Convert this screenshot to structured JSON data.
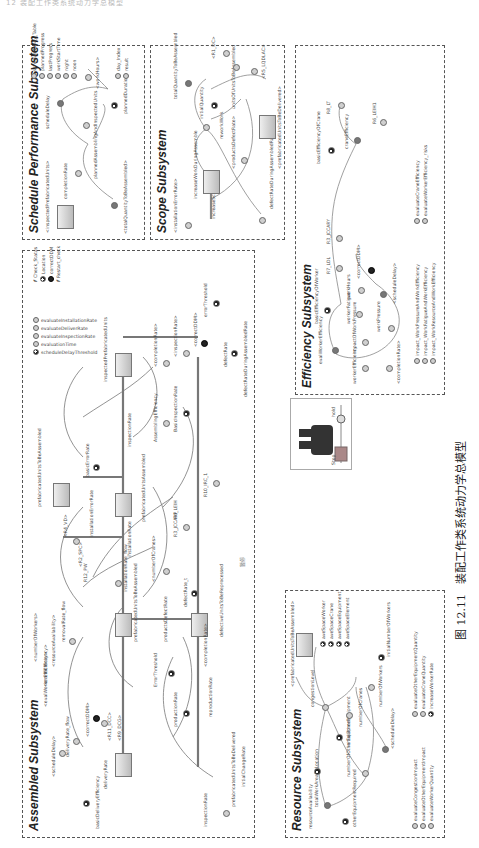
{
  "page": {
    "header_text": "12 装配工作类系统动力学总模型",
    "caption": {
      "figure_number": "图 12.11",
      "title": "装配工作类系统动力学总模型"
    }
  },
  "subsystems": {
    "schedule": {
      "title": "Schedule Performance Subsystem",
      "labels": {
        "inspected": "<inspectedPrefabricatedUnits>",
        "completion_rate": "completionRate",
        "total_quantity": "<totalQuantityToBeAssembled>",
        "planned_assembling": "plannedAssemblingAndInspectedUnits",
        "schedule_delay": "scheduleDelay",
        "planned_duration": "plannedDuration",
        "work_hours": "<workHours>"
      },
      "legend": [
        "scheduleDelay_Table",
        "plannedProgress",
        "lastProgress",
        "workStartTime",
        "night",
        "noon"
      ],
      "legend2": [
        "day_Index",
        "result"
      ]
    },
    "scope": {
      "title": "Scope Subsystem",
      "labels": {
        "install_error": "<installationErrorRate>",
        "increase_scope_rate": "increaseScopeRate",
        "increase_work": "increaseWorkDuringAssemble",
        "defect_rate": "<productsDefectRate>",
        "defect_rate_assemble": "defectRateDuringAssembledRate>",
        "rework_work": "reworkWork",
        "initial_quantity": "initialQuantity",
        "total_quantity": "totalQuantityToBeAssembled",
        "total_units": "unitsOfUnitsToBeAssembled",
        "r1_dc": "<R1_DC>",
        "r5_lqdlac": "<R5_LQDLAC>",
        "prefab_delivered": "<prefabricatedUnitsToBeDelivered>"
      }
    },
    "efficiency": {
      "title": "Efficiency Subsystem",
      "labels": {
        "basic_eff_worker": "basicEfficiencyOfWorker",
        "eval_worker_eff": "evalWorkerEfficiency",
        "worker_eff": "workerEfficiency",
        "impact_work_pressure": "impactOfWorkPressure",
        "worker_fatigue": "workerFatigue",
        "work_pressure": "workPressure",
        "completion_rate": "<completionRate>",
        "work_hours": "workHours",
        "correct_ddm": "<correctDDM>",
        "schedule_delay": "<scheduleDelay>",
        "r7_ldl": "R7_LDL",
        "r3_jccary": "R3_JCCARY",
        "basic_eff_crane": "basicEfficiencyOfCrane",
        "crane_eff": "craneEfficiency",
        "r8_lt": "R8_LT",
        "r6_leih": "R6_LEIH1"
      },
      "legend": [
        "impact_WorkPressureAndWorkEfficiency",
        "impact_WorkFatigueAndWorkEfficiency",
        "impact_WorkResourceAndWorkEfficiency"
      ],
      "legend2": [
        "evaluateCraneEfficiency",
        "evaluateWorkerEfficiency_risks"
      ]
    },
    "resource": {
      "title": "Resource Subsystem",
      "labels": {
        "resource_avail": "resourceAvailability",
        "total_work_area": "totalWorkAreaByLocation",
        "other_equipment_req": "otherEquipmentRequired",
        "number_other_equip": "numberOfOtherEquipment",
        "initial_other_equip": "initialOtherEquipment",
        "schedule_delay": "<scheduleDelay>",
        "number_cranes": "numberOfCranes",
        "number_workers": "numberOfWorkers",
        "congestion": "congestionLevel",
        "prefab_assembled": "<prefabricatedUnitsToBeAssembled>",
        "initial_workers": "initialNumberOfWorkers"
      },
      "space_legend": [
        "aveSpaceWorker",
        "aveSpaceCrane",
        "aveSpaceEquipment",
        "aveSpaceElement"
      ],
      "legend": [
        "evaluateCongestionImpact",
        "evaluateOtherEquipmentImpact",
        "evaluateWorkerQuantity"
      ],
      "legend2": [
        "evaluateOtherEquipmentQuantity",
        "evaluateCraneQuantity",
        "increaseWorkerRate"
      ]
    },
    "assembled": {
      "title": "Assembled Subsystem",
      "labels": {
        "basic_delivery_eff": "basicDeliveryEfficiency",
        "delivery_rate": "deliveryRate",
        "delivery_rate_flow": "deliveryRate_flow",
        "schedule_delay": "<scheduleDelay>",
        "correct_ddm": "<correctDDM>",
        "r11_dcc": "<R11_DCC>",
        "r9_dcg": "<R9_DCG>",
        "prefab_units_to_deliver": "prefabricatedUnitsToBeDelivered",
        "inspection_rate": "inspectionRate",
        "initial_change_rate": "initialChangeRate",
        "eval_worker_eff": "<evalWorkerEfficiency>",
        "crane_eff": "<craneEfficiency>",
        "resource_avail": "<resourceAvailability>",
        "number_workers": "<numberOfWorkers>",
        "removal_rate_flow": "removalRate_flow",
        "prefab_to_assemble": "prefabricatedUnitsToBeAssembled",
        "production_rate": "productionRate",
        "reproduction_rate": "reproductionRate",
        "error_threshold": "ErrorThreshold",
        "products_defect_rate": "productsDefectRate",
        "defect_rate": "defectRate_t",
        "completion_rate": "<completionRate>",
        "defective_units": "defectiveUnitsToBeReprocessed",
        "number_cranes": "<numberOfCranes>",
        "install_rate_flow": "installationRate_flow",
        "installation_rate": "installationRate",
        "r12_pw": "R12_PW",
        "r2_spc": "<R2_SPC>",
        "r4_vd": "<R4_VD>",
        "installation_error_rate": "installationErrorRate",
        "prefab_to_be_assembled": "prefabricatedUnitsToBeAssembled",
        "prefab_assembled": "prefabricatedUnitsAssembled",
        "r3_jccarp": "R3_JCCARP",
        "r6_leih": "R6_LEIH",
        "r10_irc": "R10_IRC_1",
        "basic_error_rate": "basicErrorRate",
        "inspected_units": "inspectedPrefabricatedUnits",
        "assembling_eff": "AssemblingEfficiency",
        "basic_inspection_rate": "BasicInspectionRate",
        "completion_rate2": "<completionRate>",
        "inspection_rate2": "<inspectionRate>",
        "correct_ddm2": "<correctDDM>",
        "error_threshold2": "errorThreshold",
        "defect_rate2": "defectRate",
        "defect_rate_ass": "defectRateDuringAssembledRate",
        "hold_note": "暂停"
      },
      "legend": [
        "evaluateInstallationRate",
        "evaluateDeliverRate",
        "evaluateInspectionRate",
        "evaluationTime",
        "scheduleDelayThreshold"
      ],
      "legend2": [
        "Check_Status",
        "Location",
        "correctDDM",
        "Restart_check"
      ]
    },
    "hold": {
      "label": "hold",
      "side_label": "Stop"
    }
  }
}
